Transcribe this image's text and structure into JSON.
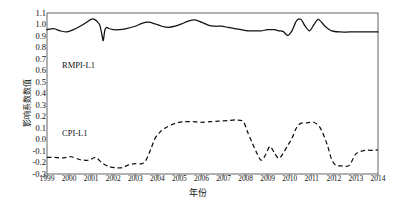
{
  "chart_data": {
    "type": "line",
    "title": "",
    "xlabel": "年份",
    "ylabel": "影响系数数值",
    "ylim": [
      -0.3,
      1.1
    ],
    "xlim": [
      1999,
      2014
    ],
    "grid": false,
    "legend_position": "inline-annotation",
    "yticks": [
      "1.1",
      "1.0",
      "0.9",
      "0.8",
      "0.7",
      "0.6",
      "0.5",
      "0.4",
      "0.3",
      "0.2",
      "0.1",
      "0.0",
      "-0.1",
      "-0.2",
      "-0.3"
    ],
    "ytick_values": [
      1.1,
      1.0,
      0.9,
      0.8,
      0.7,
      0.6,
      0.5,
      0.4,
      0.3,
      0.2,
      0.1,
      0.0,
      -0.1,
      -0.2,
      -0.3
    ],
    "categories": [
      "1999",
      "2000",
      "2001",
      "2002",
      "2003",
      "2004",
      "2005",
      "2006",
      "2007",
      "2008",
      "2009",
      "2010",
      "2011",
      "2012",
      "2013",
      "2014"
    ],
    "series": [
      {
        "name": "RMPI-L1",
        "style": "solid",
        "color": "#111111",
        "x": [
          1999.0,
          1999.3,
          1999.6,
          1999.9,
          2000.2,
          2000.5,
          2000.8,
          2001.0,
          2001.15,
          2001.3,
          2001.4,
          2001.5,
          2001.55,
          2001.62,
          2001.7,
          2001.8,
          2002.0,
          2002.3,
          2002.6,
          2003.0,
          2003.3,
          2003.6,
          2003.9,
          2004.2,
          2004.5,
          2004.8,
          2005.1,
          2005.4,
          2005.7,
          2006.0,
          2006.3,
          2006.6,
          2006.9,
          2007.2,
          2007.5,
          2007.8,
          2008.1,
          2008.4,
          2008.7,
          2009.0,
          2009.3,
          2009.5,
          2009.7,
          2009.9,
          2010.1,
          2010.3,
          2010.5,
          2010.7,
          2010.9,
          2011.1,
          2011.3,
          2011.6,
          2011.9,
          2012.3,
          2012.7,
          2013.1,
          2013.5,
          2014.0
        ],
        "values": [
          0.955,
          0.965,
          0.945,
          0.935,
          0.955,
          0.985,
          1.02,
          1.045,
          1.045,
          1.02,
          0.99,
          0.9,
          0.86,
          0.95,
          0.975,
          0.965,
          0.955,
          0.955,
          0.965,
          0.985,
          1.01,
          1.02,
          1.005,
          0.985,
          0.975,
          0.985,
          1.005,
          1.03,
          1.04,
          1.02,
          0.995,
          0.985,
          0.985,
          0.975,
          0.965,
          0.955,
          0.945,
          0.945,
          0.945,
          0.955,
          0.955,
          0.945,
          0.94,
          0.905,
          0.945,
          1.03,
          1.045,
          0.985,
          0.945,
          1.0,
          1.045,
          0.985,
          0.945,
          0.935,
          0.935,
          0.935,
          0.935,
          0.935
        ]
      },
      {
        "name": "CPI-L1",
        "style": "dashed",
        "color": "#111111",
        "x": [
          1999.0,
          1999.3,
          1999.7,
          2000.1,
          2000.5,
          2000.9,
          2001.2,
          2001.5,
          2001.8,
          2002.1,
          2002.4,
          2002.7,
          2003.0,
          2003.3,
          2003.5,
          2003.7,
          2003.9,
          2004.1,
          2004.4,
          2004.8,
          2005.2,
          2005.6,
          2006.0,
          2006.4,
          2006.8,
          2007.2,
          2007.6,
          2007.9,
          2008.1,
          2008.3,
          2008.5,
          2008.7,
          2008.9,
          2009.1,
          2009.3,
          2009.5,
          2009.7,
          2009.9,
          2010.1,
          2010.3,
          2010.5,
          2010.8,
          2011.1,
          2011.4,
          2011.7,
          2011.9,
          2012.1,
          2012.4,
          2012.7,
          2013.0,
          2013.4,
          2013.8,
          2014.0
        ],
        "values": [
          -0.155,
          -0.155,
          -0.16,
          -0.15,
          -0.175,
          -0.18,
          -0.155,
          -0.205,
          -0.235,
          -0.245,
          -0.245,
          -0.22,
          -0.21,
          -0.21,
          -0.175,
          -0.085,
          0.01,
          0.06,
          0.105,
          0.14,
          0.155,
          0.155,
          0.15,
          0.155,
          0.16,
          0.165,
          0.17,
          0.155,
          0.06,
          -0.03,
          -0.115,
          -0.18,
          -0.135,
          -0.06,
          -0.115,
          -0.165,
          -0.12,
          -0.055,
          0.01,
          0.1,
          0.14,
          0.145,
          0.15,
          0.095,
          -0.045,
          -0.175,
          -0.225,
          -0.23,
          -0.225,
          -0.125,
          -0.095,
          -0.095,
          -0.09
        ]
      }
    ],
    "annotations": [
      {
        "text": "RMPI-L1",
        "x_px": 62,
        "y_px": 60
      },
      {
        "text": "CPI-L1",
        "x_px": 62,
        "y_px": 128
      }
    ],
    "plot_frame": {
      "left": 47,
      "top": 13,
      "right": 378,
      "bottom": 174
    },
    "frame_color": "#555555",
    "background": "#ffffff"
  }
}
